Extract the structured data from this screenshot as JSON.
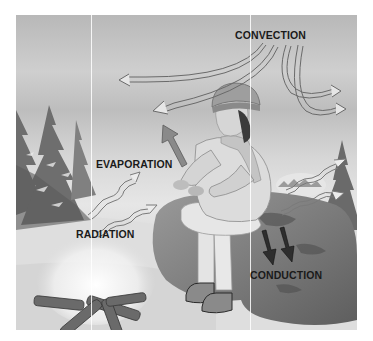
{
  "figure": {
    "style": "grayscale",
    "labels": {
      "convection": "CONVECTION",
      "evaporation": "EVAPORATION",
      "radiation": "RADIATION",
      "conduction": "CONDUCTION"
    },
    "arrows": {
      "convection": {
        "count": 4,
        "style": "outlined, curving from top center outward"
      },
      "evaporation": {
        "count": 1,
        "direction": "up-left",
        "color": "#8a8a8a"
      },
      "radiation": {
        "count": 4,
        "style": "outlined wavy"
      },
      "conduction": {
        "count": 2,
        "direction": "down",
        "color": "#2a2a2a"
      }
    },
    "colors": {
      "sky": "#c4c4c4",
      "snow": "#e8e8e8",
      "rock": "#7a7a7a",
      "label_text": "#1a1a1a"
    }
  }
}
